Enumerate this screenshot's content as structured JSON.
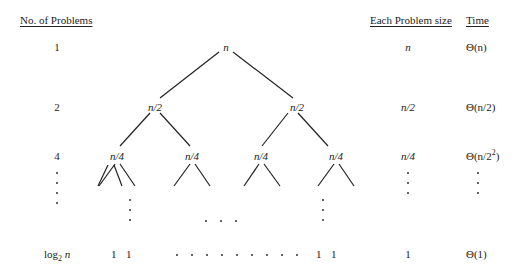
{
  "headers": {
    "num_problems": "No. of Problems",
    "problem_size": "Each Problem size",
    "time": "Time"
  },
  "rows": [
    {
      "num": "1",
      "size": "n",
      "time": "Θ(n)"
    },
    {
      "num": "2",
      "size": "n/2",
      "time": "Θ(n/2)"
    },
    {
      "num": "4",
      "size": "n/4",
      "time_prefix": "Θ(n/2",
      "time_sup": "2",
      "time_suffix": ")"
    },
    {
      "num_base": "log",
      "num_sub": "2",
      "num_var": " n",
      "size": "1",
      "time": "Θ(1)"
    }
  ],
  "tree": {
    "root": "n",
    "level1": [
      "n/2",
      "n/2"
    ],
    "level2": [
      "n/4",
      "n/4",
      "n/4",
      "n/4"
    ],
    "leaves_left": [
      "1",
      "1"
    ],
    "leaves_right": [
      "1",
      "1"
    ]
  }
}
